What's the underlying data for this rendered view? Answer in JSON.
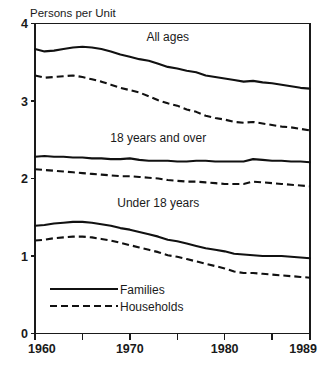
{
  "chart_data": {
    "type": "line",
    "title": "Persons per Unit",
    "xlabel": "",
    "ylabel": "Persons per Unit",
    "ylim": [
      0,
      4
    ],
    "xlim": [
      1960,
      1989
    ],
    "grid": false,
    "legend_position": "inside-bottom-left",
    "y_ticks": [
      "0",
      "1",
      "2",
      "3",
      "4"
    ],
    "y_tick_values": [
      0,
      1,
      2,
      3,
      4
    ],
    "x_ticks": [
      "1960",
      "1970",
      "1980",
      "1989"
    ],
    "x_tick_values": [
      1960,
      1970,
      1980,
      1989
    ],
    "x_minor_tick_values": [
      1965,
      1975,
      1985
    ],
    "group_labels": [
      {
        "text": "All ages",
        "x": 1974,
        "y": 3.78
      },
      {
        "text": "18 years and over",
        "x": 1973,
        "y": 2.47
      },
      {
        "text": "Under 18 years",
        "x": 1973,
        "y": 1.63
      }
    ],
    "legend": [
      {
        "label": "Families",
        "style": "solid"
      },
      {
        "label": "Households",
        "style": "dashed"
      }
    ],
    "x": [
      1960,
      1961,
      1962,
      1963,
      1964,
      1965,
      1966,
      1967,
      1968,
      1969,
      1970,
      1971,
      1972,
      1973,
      1974,
      1975,
      1976,
      1977,
      1978,
      1979,
      1980,
      1981,
      1982,
      1983,
      1984,
      1985,
      1986,
      1987,
      1988,
      1989
    ],
    "series": [
      {
        "name": "All ages - Families",
        "group": "All ages",
        "style": "solid",
        "values": [
          3.67,
          3.64,
          3.65,
          3.67,
          3.69,
          3.7,
          3.69,
          3.67,
          3.64,
          3.6,
          3.57,
          3.54,
          3.52,
          3.48,
          3.44,
          3.42,
          3.39,
          3.37,
          3.33,
          3.31,
          3.29,
          3.27,
          3.25,
          3.26,
          3.24,
          3.23,
          3.21,
          3.19,
          3.17,
          3.16
        ]
      },
      {
        "name": "All ages - Households",
        "group": "All ages",
        "style": "dashed",
        "values": [
          3.33,
          3.3,
          3.31,
          3.32,
          3.33,
          3.31,
          3.28,
          3.25,
          3.21,
          3.17,
          3.14,
          3.11,
          3.06,
          3.01,
          2.97,
          2.94,
          2.89,
          2.86,
          2.81,
          2.78,
          2.76,
          2.73,
          2.72,
          2.73,
          2.71,
          2.69,
          2.67,
          2.66,
          2.64,
          2.62
        ]
      },
      {
        "name": "18 years and over - Families",
        "group": "18 years and over",
        "style": "solid",
        "values": [
          2.28,
          2.29,
          2.28,
          2.28,
          2.27,
          2.27,
          2.26,
          2.26,
          2.25,
          2.25,
          2.26,
          2.24,
          2.23,
          2.23,
          2.23,
          2.22,
          2.22,
          2.23,
          2.23,
          2.22,
          2.22,
          2.22,
          2.22,
          2.25,
          2.24,
          2.23,
          2.23,
          2.22,
          2.22,
          2.21
        ]
      },
      {
        "name": "18 years and over - Households",
        "group": "18 years and over",
        "style": "dashed",
        "values": [
          2.12,
          2.11,
          2.1,
          2.09,
          2.08,
          2.07,
          2.06,
          2.05,
          2.04,
          2.03,
          2.03,
          2.02,
          2.01,
          2.0,
          1.98,
          1.97,
          1.96,
          1.96,
          1.95,
          1.94,
          1.93,
          1.93,
          1.93,
          1.96,
          1.95,
          1.94,
          1.93,
          1.92,
          1.91,
          1.9
        ]
      },
      {
        "name": "Under 18 years - Families",
        "group": "Under 18 years",
        "style": "solid",
        "values": [
          1.39,
          1.4,
          1.42,
          1.43,
          1.44,
          1.44,
          1.43,
          1.41,
          1.39,
          1.36,
          1.34,
          1.31,
          1.28,
          1.25,
          1.21,
          1.19,
          1.16,
          1.13,
          1.1,
          1.08,
          1.06,
          1.03,
          1.02,
          1.01,
          1.0,
          1.0,
          1.0,
          0.99,
          0.98,
          0.97
        ]
      },
      {
        "name": "Under 18 years - Households",
        "group": "Under 18 years",
        "style": "dashed",
        "values": [
          1.2,
          1.21,
          1.23,
          1.24,
          1.25,
          1.25,
          1.24,
          1.22,
          1.2,
          1.17,
          1.14,
          1.11,
          1.08,
          1.05,
          1.01,
          0.99,
          0.96,
          0.93,
          0.9,
          0.87,
          0.84,
          0.8,
          0.78,
          0.78,
          0.77,
          0.76,
          0.75,
          0.74,
          0.73,
          0.72
        ]
      }
    ]
  }
}
